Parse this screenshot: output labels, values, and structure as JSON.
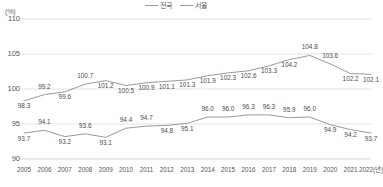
{
  "chart_data": {
    "type": "line",
    "title": "",
    "subtitle": "",
    "xlabel": "",
    "ylabel": "(%)",
    "unit_label": "(%)",
    "x_axis_suffix_label": "2022(년)",
    "categories": [
      "2005",
      "2006",
      "2007",
      "2008",
      "2009",
      "2010",
      "2011",
      "2012",
      "2013",
      "2014",
      "2015",
      "2016",
      "2017",
      "2018",
      "2019",
      "2020",
      "2021",
      "2022"
    ],
    "tick_labels": [
      "2005",
      "2006",
      "2007",
      "2008",
      "2009",
      "2010",
      "2011",
      "2012",
      "2013",
      "2014",
      "2015",
      "2016",
      "2017",
      "2018",
      "2019",
      "2020",
      "2021",
      "2022(년)"
    ],
    "ylim": [
      90,
      110
    ],
    "yticks": [
      90,
      95,
      100,
      105,
      110
    ],
    "grid": true,
    "legend_position": "top-center",
    "series": [
      {
        "name": "전국",
        "color": "#9a9a9a",
        "values": [
          98.3,
          99.2,
          99.6,
          100.7,
          101.2,
          100.5,
          100.9,
          101.1,
          101.3,
          101.9,
          102.3,
          102.6,
          103.3,
          104.2,
          104.8,
          103.6,
          102.2,
          102.1
        ],
        "labels": [
          "98.3",
          "99.2",
          "99.6",
          "100.7",
          "101.2",
          "100.5",
          "100.9",
          "101.1",
          "101.3",
          "101.9",
          "102.3",
          "102.6",
          "103.3",
          "104.2",
          "104.8",
          "103.6",
          "102.2",
          "102.1"
        ],
        "label_positions": [
          "below",
          "above",
          "below",
          "above",
          "below",
          "below",
          "below",
          "below",
          "below",
          "below",
          "below",
          "below",
          "below",
          "below",
          "above",
          "above",
          "below",
          "below"
        ]
      },
      {
        "name": "서울",
        "color": "#9a9a9a",
        "values": [
          93.7,
          94.1,
          93.2,
          93.6,
          93.1,
          94.4,
          94.7,
          94.8,
          95.1,
          96.0,
          96.0,
          96.3,
          96.3,
          95.9,
          96.0,
          94.9,
          94.2,
          93.7
        ],
        "labels": [
          "93.7",
          "94.1",
          "93.2",
          "93.6",
          "93.1",
          "94.4",
          "94.7",
          "94.8",
          "95.1",
          "96.0",
          "96.0",
          "96.3",
          "96.3",
          "95.9",
          "96.0",
          "94.9",
          "94.2",
          "93.7"
        ],
        "label_positions": [
          "below",
          "above",
          "below",
          "above",
          "below",
          "above",
          "above",
          "below",
          "below",
          "above",
          "above",
          "above",
          "above",
          "above",
          "above",
          "below",
          "below",
          "below"
        ]
      }
    ]
  }
}
